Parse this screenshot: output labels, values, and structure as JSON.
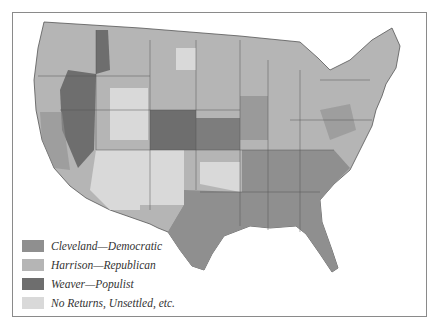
{
  "map": {
    "subject": "1892 United States presidential election results by county",
    "colors": {
      "democratic": "#8f8f8f",
      "republican": "#b5b5b5",
      "populist": "#6e6e6e",
      "no_returns": "#d9d9d9",
      "border": "#555555",
      "frame": "#8a8a8a"
    }
  },
  "legend": {
    "items": [
      {
        "label": "Cleveland—Democratic",
        "color": "#8f8f8f"
      },
      {
        "label": "Harrison—Republican",
        "color": "#b5b5b5"
      },
      {
        "label": "Weaver—Populist",
        "color": "#6e6e6e"
      },
      {
        "label": "No Returns, Unsettled, etc.",
        "color": "#d9d9d9"
      }
    ]
  }
}
